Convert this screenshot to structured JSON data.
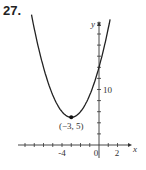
{
  "problem_number": "27.",
  "chart_data": {
    "type": "line",
    "title": "",
    "function": "y = (x + 3)^2 + 5",
    "xlabel": "x",
    "ylabel": "y",
    "x_tick_labels": [
      "-4",
      "0",
      "2"
    ],
    "y_tick_labels": [
      "10"
    ],
    "xlim": [
      -8.5,
      3
    ],
    "ylim": [
      0,
      24
    ],
    "x_tick_step": 1,
    "y_tick_step": 2,
    "grid": false,
    "legend": null,
    "points": [
      {
        "x": -3,
        "y": 5,
        "label": "(−3, 5)"
      }
    ],
    "series": [
      {
        "name": "parabola",
        "x": [
          -7.3,
          -6,
          -5,
          -4,
          -3,
          -2,
          -1,
          0,
          1,
          1.2
        ],
        "y": [
          23.5,
          14,
          9,
          6,
          5,
          6,
          9,
          14,
          21,
          22.6
        ]
      }
    ]
  }
}
